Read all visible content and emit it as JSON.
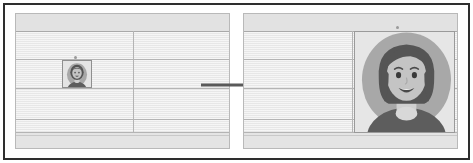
{
  "figure": {
    "kind": "before-after-illustration",
    "arrow": {
      "name": "transformation-arrow",
      "direction": "right",
      "color": "#5a5a5a"
    },
    "frame_color": "#2e2e2e",
    "sheet_color": "#eaeaea",
    "gridline_color": "#b4b4b4"
  },
  "before_panel": {
    "name": "before-spreadsheet",
    "label": "",
    "rows": 5,
    "columns": 2,
    "thumbnail": {
      "name": "profile-thumbnail",
      "alt": "small profile photo of a smiling woman",
      "cell": "row 3, column 1"
    }
  },
  "after_panel": {
    "name": "after-spreadsheet",
    "label": "",
    "rows": 5,
    "columns": 2,
    "enlarged_image": {
      "name": "profile-picture-large",
      "alt": "large profile photo of a smiling woman with dark bob hair on a gray circle background"
    }
  },
  "avatar": {
    "name": "woman-avatar",
    "colors": {
      "circle_background": "#a8a8a8",
      "hair": "#555555",
      "skin": "#c4c4c4",
      "shirt": "#5d5d5d",
      "neck": "#cfcfcf",
      "mouth": "#4a4a4a",
      "teeth": "#f0f0f0",
      "eyes": "#3a3a3a"
    }
  }
}
